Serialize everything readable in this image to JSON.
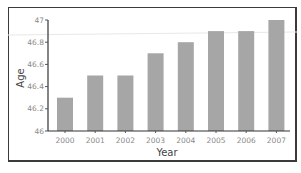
{
  "chart_data": {
    "type": "bar",
    "title": "",
    "xlabel": "Year",
    "ylabel": "Age",
    "categories": [
      "2000",
      "2001",
      "2002",
      "2003",
      "2004",
      "2005",
      "2006",
      "2007"
    ],
    "values": [
      46.3,
      46.5,
      46.5,
      46.7,
      46.8,
      46.9,
      46.9,
      47.0
    ],
    "ylim": [
      46,
      47
    ],
    "yticks": [
      "46",
      "46.2",
      "46.4",
      "46.6",
      "46.8",
      "47"
    ],
    "grid": false,
    "legend": null,
    "bar_color": "#a6a6a6"
  }
}
